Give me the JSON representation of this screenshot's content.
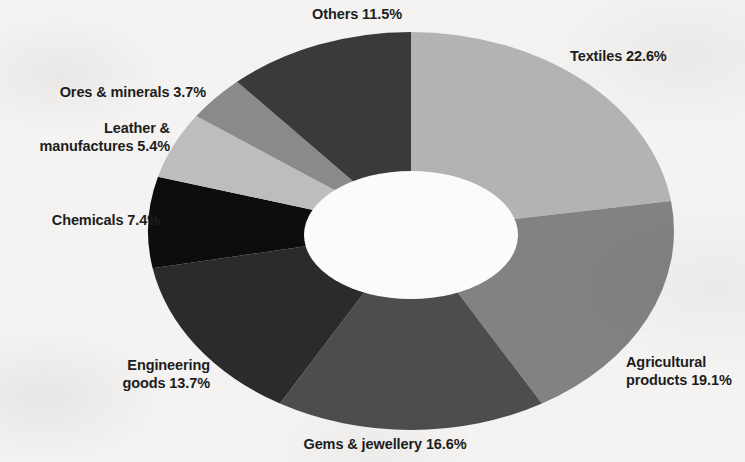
{
  "chart_data": {
    "type": "pie",
    "variant": "donut",
    "title": "",
    "subtitle": "",
    "xlabel": "",
    "ylabel": "",
    "units": "percent",
    "total": 100,
    "legend": "none",
    "grid": false,
    "label_format": "{name} {value}%",
    "start_angle_deg": 0,
    "direction": "clockwise",
    "categories": [
      "Textiles",
      "Agricultural products",
      "Gems & jewellery",
      "Engineering goods",
      "Chemicals",
      "Leather & manufactures",
      "Ores & minerals",
      "Others"
    ],
    "values": [
      22.6,
      19.1,
      16.6,
      13.7,
      7.4,
      5.4,
      3.7,
      11.5
    ],
    "colors": [
      "#b3b3b3",
      "#828282",
      "#4d4d4d",
      "#2b2b2b",
      "#0d0d0d",
      "#bdbdbd",
      "#8a8a8a",
      "#3a3a3a"
    ],
    "slices": [
      {
        "name": "Textiles",
        "value": 22.6,
        "color": "#b3b3b3"
      },
      {
        "name": "Agricultural products",
        "value": 19.1,
        "color": "#828282"
      },
      {
        "name": "Gems & jewellery",
        "value": 16.6,
        "color": "#4d4d4d"
      },
      {
        "name": "Engineering goods",
        "value": 13.7,
        "color": "#2b2b2b"
      },
      {
        "name": "Chemicals",
        "value": 7.4,
        "color": "#0d0d0d"
      },
      {
        "name": "Leather & manufactures",
        "value": 5.4,
        "color": "#bdbdbd"
      },
      {
        "name": "Ores & minerals",
        "value": 3.7,
        "color": "#8a8a8a"
      },
      {
        "name": "Others",
        "value": 11.5,
        "color": "#3a3a3a"
      }
    ]
  },
  "labels": {
    "others": {
      "line1": "Others 11.5%"
    },
    "textiles": {
      "line1": "Textiles 22.6%"
    },
    "ores": {
      "line1": "Ores & minerals 3.7%"
    },
    "leather": {
      "line1": "Leather &",
      "line2": "manufactures 5.4%"
    },
    "chemicals": {
      "line1": "Chemicals 7.4%"
    },
    "engineering": {
      "line1": "Engineering",
      "line2": "goods 13.7%"
    },
    "gems": {
      "line1": "Gems & jewellery 16.6%"
    },
    "agricultural": {
      "line1": "Agricultural",
      "line2": "products 19.1%"
    }
  },
  "style": {
    "background": "#f4f3f1",
    "hole_fill": "#fbfbfa",
    "text_color": "#1d1d1d"
  }
}
